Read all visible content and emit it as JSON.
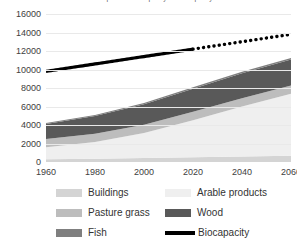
{
  "chart_data": {
    "type": "area",
    "title": "Global production capacity vs biocapacity",
    "xlabel": "",
    "ylabel": "",
    "x": [
      1960,
      1980,
      2000,
      2020,
      2040,
      2060
    ],
    "xlim": [
      1960,
      2060
    ],
    "ylim": [
      0,
      16000
    ],
    "xticks": [
      "1960",
      "1980",
      "2000",
      "2020",
      "2040",
      "2060"
    ],
    "yticks": [
      "0",
      "2000",
      "4000",
      "6000",
      "8000",
      "10000",
      "12000",
      "14000",
      "16000"
    ],
    "ytick_step": 2000,
    "grid": true,
    "legend_position": "bottom",
    "stacked": true,
    "series": [
      {
        "name": "Buildings",
        "color": "#d4d4d4",
        "values": [
          300,
          360,
          430,
          520,
          600,
          680
        ]
      },
      {
        "name": "Arable products",
        "color": "#efefef",
        "values": [
          1300,
          1800,
          2700,
          4000,
          5400,
          6700
        ]
      },
      {
        "name": "Pasture grass",
        "color": "#bdbdbd",
        "values": [
          900,
          900,
          900,
          900,
          900,
          900
        ]
      },
      {
        "name": "Wood",
        "color": "#595959",
        "values": [
          1600,
          1900,
          2200,
          2500,
          2700,
          2800
        ]
      },
      {
        "name": "Fish",
        "color": "#7f7f7f",
        "values": [
          120,
          130,
          140,
          150,
          150,
          150
        ]
      }
    ],
    "line_series": [
      {
        "name": "Biocapacity",
        "color": "#000000",
        "solid_range": [
          1960,
          2020
        ],
        "dotted_range": [
          2020,
          2060
        ],
        "x": [
          1960,
          1980,
          2000,
          2020,
          2040,
          2060
        ],
        "values": [
          9800,
          10600,
          11400,
          12200,
          13000,
          13800
        ]
      }
    ]
  },
  "legend": {
    "items": [
      {
        "label": "Buildings",
        "swatch": "#d4d4d4",
        "kind": "area"
      },
      {
        "label": "Arable products",
        "swatch": "#efefef",
        "kind": "area"
      },
      {
        "label": "Pasture grass",
        "swatch": "#bdbdbd",
        "kind": "area"
      },
      {
        "label": "Wood",
        "swatch": "#595959",
        "kind": "area"
      },
      {
        "label": "Fish",
        "swatch": "#7f7f7f",
        "kind": "area"
      },
      {
        "label": "Biocapacity",
        "swatch": "#000000",
        "kind": "line"
      }
    ]
  }
}
